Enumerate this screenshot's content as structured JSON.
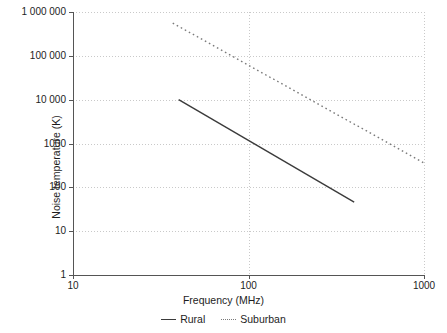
{
  "chart_data": {
    "type": "line",
    "title": "",
    "xlabel": "Frequency (MHz)",
    "ylabel": "Noise temperature (K)",
    "xscale": "log",
    "yscale": "log",
    "xlim": [
      10,
      1000
    ],
    "ylim": [
      1,
      1000000
    ],
    "grid": true,
    "legend_position": "bottom",
    "xticks": [
      10,
      100,
      1000
    ],
    "xticklabels": [
      "10",
      "100",
      "1000"
    ],
    "yticks": [
      1,
      10,
      100,
      1000,
      10000,
      100000,
      1000000
    ],
    "yticklabels": [
      "1",
      "10",
      "100",
      "1000",
      "10 000",
      "100 000",
      "1 000 000"
    ],
    "series": [
      {
        "name": "Rural",
        "style": "solid",
        "color": "#3b3b3b",
        "x": [
          40,
          400
        ],
        "y": [
          10000,
          46
        ]
      },
      {
        "name": "Suburban",
        "style": "dotted",
        "color": "#7a7a7a",
        "x": [
          37,
          1000
        ],
        "y": [
          560000,
          360
        ]
      }
    ]
  },
  "axes": {
    "x_title": "Frequency (MHz)",
    "y_title": "Noise temperature (K)"
  },
  "legend": {
    "items": [
      {
        "label": "Rural",
        "style": "solid"
      },
      {
        "label": "Suburban",
        "style": "dotted"
      }
    ]
  },
  "colors": {
    "background": "#ffffff",
    "axis": "#555555",
    "grid": "#c9c9c9",
    "rural": "#3b3b3b",
    "suburban": "#7a7a7a",
    "text": "#1d1d1d"
  }
}
